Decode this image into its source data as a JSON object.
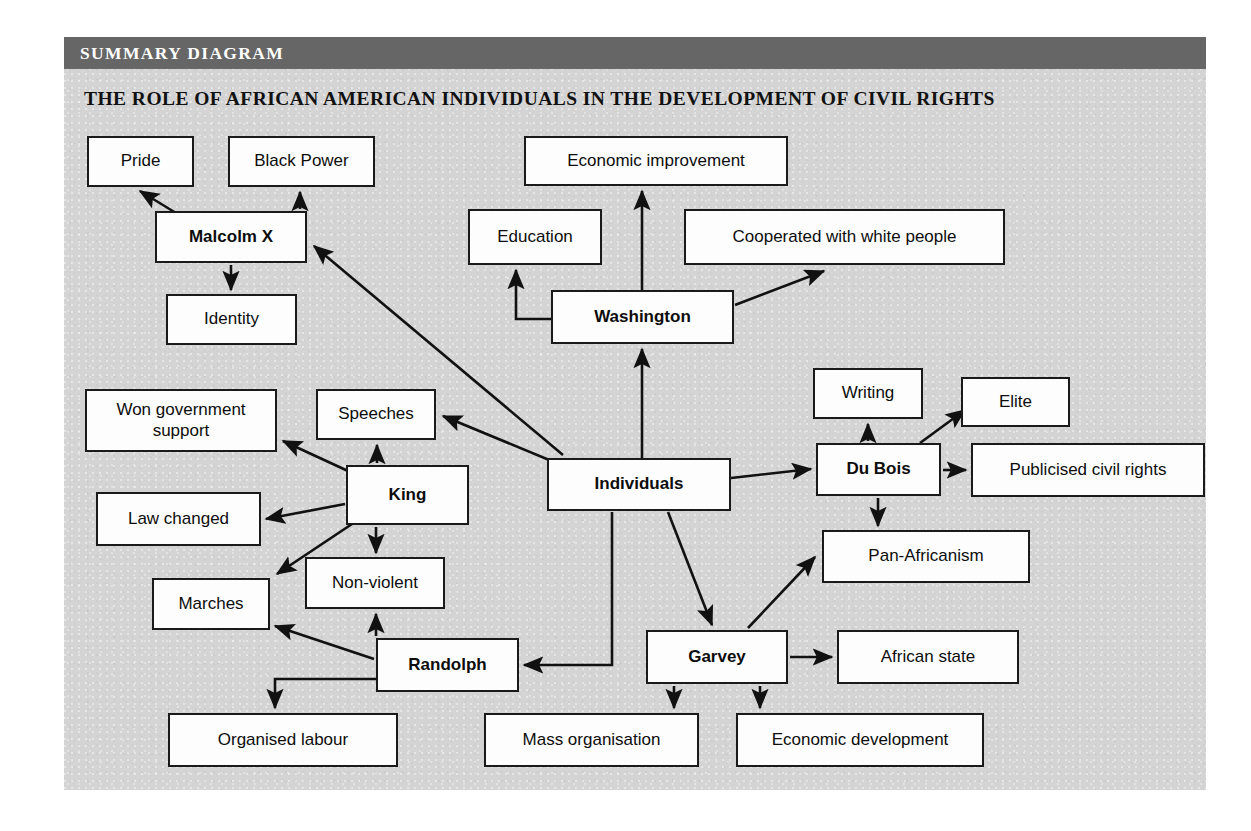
{
  "header": {
    "badge_label": "SUMMARY DIAGRAM",
    "title": "THE ROLE OF AFRICAN AMERICAN INDIVIDUALS IN THE DEVELOPMENT OF CIVIL RIGHTS",
    "badge_bg": "#666666",
    "panel_bg": "#d4d4d4",
    "page_bg": "#ffffff"
  },
  "diagram": {
    "type": "concept-map",
    "root": "Individuals",
    "node_fill": "#fdfdfd",
    "node_stroke": "#1a1a1a",
    "nodes": [
      {
        "id": "pride",
        "label": "Pride",
        "bold": false,
        "x": 87,
        "y": 136,
        "w": 107,
        "h": 51
      },
      {
        "id": "black-power",
        "label": "Black Power",
        "bold": false,
        "x": 228,
        "y": 136,
        "w": 147,
        "h": 51
      },
      {
        "id": "malcolm-x",
        "label": "Malcolm X",
        "bold": true,
        "x": 155,
        "y": 211,
        "w": 152,
        "h": 52
      },
      {
        "id": "identity",
        "label": "Identity",
        "bold": false,
        "x": 166,
        "y": 294,
        "w": 131,
        "h": 51
      },
      {
        "id": "economic-improvement",
        "label": "Economic improvement",
        "bold": false,
        "x": 524,
        "y": 136,
        "w": 264,
        "h": 50
      },
      {
        "id": "education",
        "label": "Education",
        "bold": false,
        "x": 468,
        "y": 209,
        "w": 134,
        "h": 56
      },
      {
        "id": "cooperated",
        "label": "Cooperated with white people",
        "bold": false,
        "x": 684,
        "y": 209,
        "w": 321,
        "h": 56
      },
      {
        "id": "washington",
        "label": "Washington",
        "bold": true,
        "x": 551,
        "y": 290,
        "w": 183,
        "h": 54
      },
      {
        "id": "writing",
        "label": "Writing",
        "bold": false,
        "x": 813,
        "y": 368,
        "w": 110,
        "h": 51
      },
      {
        "id": "elite",
        "label": "Elite",
        "bold": false,
        "x": 961,
        "y": 377,
        "w": 109,
        "h": 50
      },
      {
        "id": "du-bois",
        "label": "Du Bois",
        "bold": true,
        "x": 816,
        "y": 443,
        "w": 125,
        "h": 53
      },
      {
        "id": "publicised",
        "label": "Publicised civil rights",
        "bold": false,
        "x": 971,
        "y": 443,
        "w": 234,
        "h": 54
      },
      {
        "id": "pan-africanism",
        "label": "Pan-Africanism",
        "bold": false,
        "x": 822,
        "y": 530,
        "w": 208,
        "h": 53
      },
      {
        "id": "won-government-support",
        "label": "Won government support",
        "bold": false,
        "x": 85,
        "y": 389,
        "w": 192,
        "h": 63
      },
      {
        "id": "speeches",
        "label": "Speeches",
        "bold": false,
        "x": 316,
        "y": 389,
        "w": 120,
        "h": 51
      },
      {
        "id": "king",
        "label": "King",
        "bold": true,
        "x": 346,
        "y": 465,
        "w": 123,
        "h": 60
      },
      {
        "id": "law-changed",
        "label": "Law changed",
        "bold": false,
        "x": 96,
        "y": 492,
        "w": 165,
        "h": 54
      },
      {
        "id": "non-violent",
        "label": "Non-violent",
        "bold": false,
        "x": 305,
        "y": 557,
        "w": 140,
        "h": 52
      },
      {
        "id": "marches",
        "label": "Marches",
        "bold": false,
        "x": 152,
        "y": 578,
        "w": 118,
        "h": 52
      },
      {
        "id": "individuals",
        "label": "Individuals",
        "bold": true,
        "x": 547,
        "y": 458,
        "w": 184,
        "h": 53
      },
      {
        "id": "randolph",
        "label": "Randolph",
        "bold": true,
        "x": 376,
        "y": 638,
        "w": 143,
        "h": 54
      },
      {
        "id": "garvey",
        "label": "Garvey",
        "bold": true,
        "x": 646,
        "y": 630,
        "w": 142,
        "h": 54
      },
      {
        "id": "african-state",
        "label": "African state",
        "bold": false,
        "x": 837,
        "y": 630,
        "w": 182,
        "h": 54
      },
      {
        "id": "organised-labour",
        "label": "Organised labour",
        "bold": false,
        "x": 168,
        "y": 713,
        "w": 230,
        "h": 54
      },
      {
        "id": "mass-organisation",
        "label": "Mass organisation",
        "bold": false,
        "x": 484,
        "y": 713,
        "w": 215,
        "h": 54
      },
      {
        "id": "economic-development",
        "label": "Economic development",
        "bold": false,
        "x": 736,
        "y": 713,
        "w": 248,
        "h": 54
      }
    ],
    "edges": [
      {
        "from": "malcolm-x",
        "to": "pride",
        "style": "diagonal"
      },
      {
        "from": "malcolm-x",
        "to": "black-power",
        "style": "straight"
      },
      {
        "from": "malcolm-x",
        "to": "identity",
        "style": "straight"
      },
      {
        "from": "washington",
        "to": "education",
        "style": "elbow"
      },
      {
        "from": "washington",
        "to": "economic-improvement",
        "style": "straight"
      },
      {
        "from": "washington",
        "to": "cooperated",
        "style": "diagonal"
      },
      {
        "from": "individuals",
        "to": "washington",
        "style": "straight"
      },
      {
        "from": "individuals",
        "to": "malcolm-x",
        "style": "diagonal"
      },
      {
        "from": "individuals",
        "to": "speeches",
        "style": "diagonal"
      },
      {
        "from": "individuals",
        "to": "du-bois",
        "style": "diagonal"
      },
      {
        "from": "individuals",
        "to": "garvey",
        "style": "diagonal"
      },
      {
        "from": "individuals",
        "to": "randolph",
        "style": "elbow"
      },
      {
        "from": "du-bois",
        "to": "writing",
        "style": "straight"
      },
      {
        "from": "du-bois",
        "to": "elite",
        "style": "diagonal"
      },
      {
        "from": "du-bois",
        "to": "publicised",
        "style": "straight"
      },
      {
        "from": "du-bois",
        "to": "pan-africanism",
        "style": "straight"
      },
      {
        "from": "king",
        "to": "won-government-support",
        "style": "diagonal"
      },
      {
        "from": "king",
        "to": "speeches",
        "style": "straight"
      },
      {
        "from": "king",
        "to": "law-changed",
        "style": "diagonal"
      },
      {
        "from": "king",
        "to": "marches",
        "style": "diagonal"
      },
      {
        "from": "king",
        "to": "non-violent",
        "style": "straight"
      },
      {
        "from": "randolph",
        "to": "non-violent",
        "style": "straight"
      },
      {
        "from": "randolph",
        "to": "marches",
        "style": "diagonal"
      },
      {
        "from": "randolph",
        "to": "organised-labour",
        "style": "elbow"
      },
      {
        "from": "garvey",
        "to": "pan-africanism",
        "style": "diagonal"
      },
      {
        "from": "garvey",
        "to": "african-state",
        "style": "straight"
      },
      {
        "from": "garvey",
        "to": "mass-organisation",
        "style": "straight"
      },
      {
        "from": "garvey",
        "to": "economic-development",
        "style": "straight"
      }
    ]
  }
}
